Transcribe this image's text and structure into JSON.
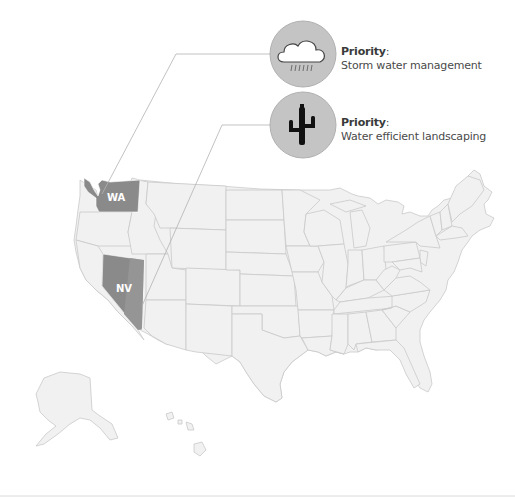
{
  "map": {
    "region": "United States",
    "base_fill": "#f1f1f1",
    "border_color": "#c9c9c9",
    "highlight_fill": "#8a8a8a",
    "highlight_fill_alt": "#939393",
    "connector_color": "#b3b3b3",
    "highlighted_states": [
      {
        "code": "WA",
        "label": "WA"
      },
      {
        "code": "NV",
        "label": "NV"
      }
    ]
  },
  "callouts": [
    {
      "state": "WA",
      "icon": "rain-cloud-icon",
      "title": "Priority",
      "colon": ":",
      "text": "Storm water management"
    },
    {
      "state": "NV",
      "icon": "cactus-icon",
      "title": "Priority",
      "colon": ":",
      "text": "Water efficient landscaping"
    }
  ],
  "colors": {
    "icon_circle": "#c4c4c4",
    "icon_circle_border": "#b0b0b0",
    "icon_dark": "#111111",
    "text": "#4a4a4a"
  }
}
